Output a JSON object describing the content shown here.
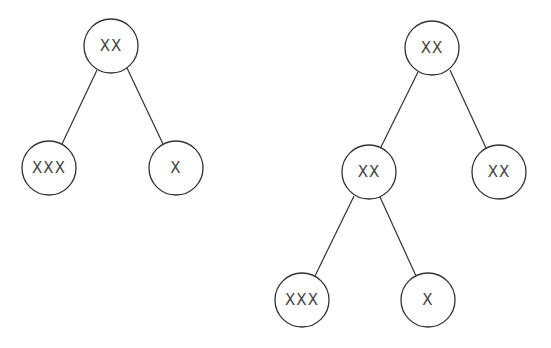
{
  "diagram": {
    "type": "binary-trees",
    "trees": [
      {
        "name": "left-tree",
        "nodes": [
          {
            "id": "l_root",
            "label": "XX",
            "cx": 111,
            "cy": 46
          },
          {
            "id": "l_left",
            "label": "XXX",
            "cx": 49,
            "cy": 168
          },
          {
            "id": "l_right",
            "label": "X",
            "cx": 176,
            "cy": 168
          }
        ],
        "edges": [
          [
            "l_root",
            "l_left"
          ],
          [
            "l_root",
            "l_right"
          ]
        ]
      },
      {
        "name": "right-tree",
        "nodes": [
          {
            "id": "r_root",
            "label": "XX",
            "cx": 432,
            "cy": 48
          },
          {
            "id": "r_mid",
            "label": "XX",
            "cx": 369,
            "cy": 172
          },
          {
            "id": "r_right",
            "label": "XX",
            "cx": 499,
            "cy": 172
          },
          {
            "id": "r_ll",
            "label": "XXX",
            "cx": 302,
            "cy": 300
          },
          {
            "id": "r_lr",
            "label": "X",
            "cx": 428,
            "cy": 300
          }
        ],
        "edges": [
          [
            "r_root",
            "r_mid"
          ],
          [
            "r_root",
            "r_right"
          ],
          [
            "r_mid",
            "r_ll"
          ],
          [
            "r_mid",
            "r_lr"
          ]
        ]
      }
    ],
    "node_radius": 27
  }
}
